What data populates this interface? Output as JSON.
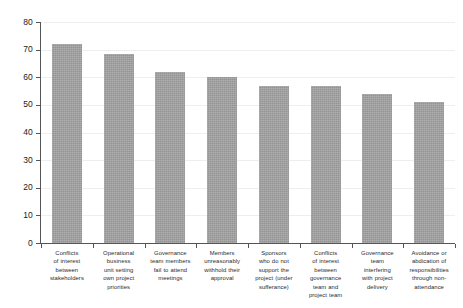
{
  "chart_data": {
    "type": "bar",
    "title": "",
    "subtitle": "",
    "xlabel": "",
    "ylabel": "",
    "ylim": [
      0,
      80
    ],
    "ytick_labels": [
      "80",
      "70",
      "60",
      "50",
      "40",
      "30",
      "20",
      "10",
      "0"
    ],
    "ytick_values": [
      80,
      70,
      60,
      50,
      40,
      30,
      20,
      10,
      0
    ],
    "grid": true,
    "grid_axis": "y",
    "legend": false,
    "legend_position": "none",
    "bar_color": "#9e9e9e",
    "background_color": "#ffffff",
    "axis_color": "#555555",
    "gridline_color": "#eeeeee",
    "categories": [
      "Conflicts of interest between stakeholders",
      "Operational business unit setting own project priorities",
      "Governance team members fail to attend meetings",
      "Members unreasonably withhold their approval",
      "Sponsors who do not support the project (under sufferance)",
      "Conflicts of interest between governance team and project team",
      "Governance team interfering with project delivery",
      "Avoidance or abdication of responsibilities through non-attendance"
    ],
    "category_lines": [
      [
        "Conflicts",
        "of interest",
        "between",
        "stakeholders"
      ],
      [
        "Operational",
        "business",
        "unit setting",
        "own project",
        "priorities"
      ],
      [
        "Governance",
        "team members",
        "fail to attend",
        "meetings"
      ],
      [
        "Members",
        "unreasonably",
        "withhold their",
        "approval"
      ],
      [
        "Sponsors",
        "who do not",
        "support the",
        "project (under",
        "sufferance)"
      ],
      [
        "Conflicts",
        "of interest",
        "between",
        "governance",
        "team and",
        "project team"
      ],
      [
        "Governance",
        "team",
        "interfering",
        "with project",
        "delivery"
      ],
      [
        "Avoidance or",
        "abdication of",
        "responsibilities",
        "through non-",
        "attendance"
      ]
    ],
    "values": [
      72,
      68.5,
      62,
      60,
      57,
      57,
      54,
      51
    ]
  }
}
